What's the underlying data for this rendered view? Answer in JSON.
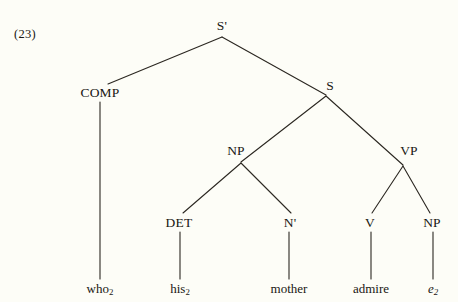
{
  "figure": {
    "example_number": "(23)",
    "type": "syntax-tree"
  },
  "tree": {
    "nodes": [
      {
        "id": "s-bar",
        "label": "S'",
        "x": 222,
        "y": 26,
        "kind": "nonterminal"
      },
      {
        "id": "comp",
        "label": "COMP",
        "x": 100,
        "y": 93,
        "kind": "nonterminal"
      },
      {
        "id": "s",
        "label": "S",
        "x": 330,
        "y": 86,
        "kind": "nonterminal"
      },
      {
        "id": "np-subj",
        "label": "NP",
        "x": 236,
        "y": 151,
        "kind": "nonterminal"
      },
      {
        "id": "vp",
        "label": "VP",
        "x": 409,
        "y": 151,
        "kind": "nonterminal"
      },
      {
        "id": "det",
        "label": "DET",
        "x": 179,
        "y": 223,
        "kind": "nonterminal"
      },
      {
        "id": "n-bar",
        "label": "N'",
        "x": 290,
        "y": 223,
        "kind": "nonterminal"
      },
      {
        "id": "v",
        "label": "V",
        "x": 370,
        "y": 223,
        "kind": "nonterminal"
      },
      {
        "id": "np-obj",
        "label": "NP",
        "x": 432,
        "y": 223,
        "kind": "nonterminal"
      }
    ],
    "terminals": [
      {
        "id": "who",
        "text": "who",
        "subscript": "2",
        "x": 100,
        "y": 288,
        "italic": false
      },
      {
        "id": "his",
        "text": "his",
        "subscript": "2",
        "x": 180,
        "y": 288,
        "italic": false
      },
      {
        "id": "mother",
        "text": "mother",
        "subscript": "",
        "x": 289,
        "y": 288,
        "italic": false
      },
      {
        "id": "admire",
        "text": "admire",
        "subscript": "",
        "x": 371,
        "y": 288,
        "italic": false
      },
      {
        "id": "trace",
        "text": "e",
        "subscript": "2",
        "x": 433,
        "y": 288,
        "italic": true
      }
    ],
    "edges": [
      {
        "from": "s-bar",
        "to": "comp",
        "x1": 222,
        "y1": 37,
        "x2": 108,
        "y2": 84
      },
      {
        "from": "s-bar",
        "to": "s",
        "x1": 222,
        "y1": 37,
        "x2": 326,
        "y2": 95
      },
      {
        "from": "comp",
        "to": "who",
        "x1": 100,
        "y1": 102,
        "x2": 100,
        "y2": 279
      },
      {
        "from": "s",
        "to": "np-subj",
        "x1": 326,
        "y1": 96,
        "x2": 241,
        "y2": 162
      },
      {
        "from": "s",
        "to": "vp",
        "x1": 326,
        "y1": 96,
        "x2": 403,
        "y2": 165
      },
      {
        "from": "np-subj",
        "to": "det",
        "x1": 241,
        "y1": 163,
        "x2": 183,
        "y2": 213
      },
      {
        "from": "np-subj",
        "to": "n-bar",
        "x1": 241,
        "y1": 163,
        "x2": 291,
        "y2": 213
      },
      {
        "from": "det",
        "to": "his",
        "x1": 180,
        "y1": 232,
        "x2": 180,
        "y2": 279
      },
      {
        "from": "n-bar",
        "to": "mother",
        "x1": 289,
        "y1": 232,
        "x2": 289,
        "y2": 279
      },
      {
        "from": "vp",
        "to": "v",
        "x1": 403,
        "y1": 166,
        "x2": 372,
        "y2": 213
      },
      {
        "from": "vp",
        "to": "np-obj",
        "x1": 403,
        "y1": 166,
        "x2": 430,
        "y2": 213
      },
      {
        "from": "v",
        "to": "admire",
        "x1": 371,
        "y1": 232,
        "x2": 371,
        "y2": 279
      },
      {
        "from": "np-obj",
        "to": "trace",
        "x1": 433,
        "y1": 232,
        "x2": 433,
        "y2": 279
      }
    ]
  },
  "style": {
    "background_color": "#fdfdf7",
    "ink_color": "#2b2721",
    "line_width": 1.1
  }
}
